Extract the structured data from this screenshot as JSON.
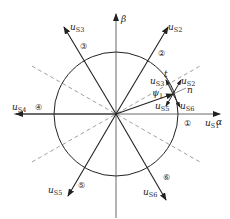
{
  "diagram": {
    "type": "space-vector-hexagon-sectors",
    "axes": {
      "alpha": "α",
      "beta": "β"
    },
    "vectors": [
      {
        "name": "u",
        "sub": "S1",
        "angle_deg": 0
      },
      {
        "name": "u",
        "sub": "S2",
        "angle_deg": 60
      },
      {
        "name": "u",
        "sub": "S3",
        "angle_deg": 120
      },
      {
        "name": "u",
        "sub": "S4",
        "angle_deg": 180
      },
      {
        "name": "u",
        "sub": "S5",
        "angle_deg": 240
      },
      {
        "name": "u",
        "sub": "S6",
        "angle_deg": 300
      }
    ],
    "sectors": [
      "①",
      "②",
      "③",
      "④",
      "⑤",
      "⑥"
    ],
    "flux_vector": {
      "name": "ψ",
      "sub": "1"
    },
    "tip_labels": {
      "t": "t",
      "n": "n"
    },
    "tip_vectors": [
      {
        "name": "u",
        "sub": "S3"
      },
      {
        "name": "u",
        "sub": "S2"
      },
      {
        "name": "u",
        "sub": "S5"
      },
      {
        "name": "u",
        "sub": "S6"
      }
    ]
  }
}
